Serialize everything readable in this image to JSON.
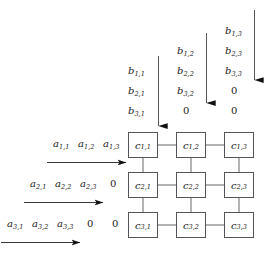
{
  "diagram": {
    "type": "systolic-array",
    "colors": {
      "stroke": "#555555",
      "text": "#1a1a1a",
      "background": "#ffffff"
    },
    "grid": {
      "rows": 3,
      "cols": 3,
      "cells": [
        [
          {
            "base": "c",
            "sub": "1,1"
          },
          {
            "base": "c",
            "sub": "1,2"
          },
          {
            "base": "c",
            "sub": "1,3"
          }
        ],
        [
          {
            "base": "c",
            "sub": "2,1"
          },
          {
            "base": "c",
            "sub": "2,2"
          },
          {
            "base": "c",
            "sub": "2,3"
          }
        ],
        [
          {
            "base": "c",
            "sub": "3,1"
          },
          {
            "base": "c",
            "sub": "3,2"
          },
          {
            "base": "c",
            "sub": "3,3"
          }
        ]
      ]
    },
    "top_inputs": {
      "description": "b matrix values fed downward into each column, skewed",
      "columns": [
        {
          "index": 1,
          "values": [
            "b_1,1",
            "b_2,1",
            "b_3,1"
          ],
          "tokens": [
            {
              "base": "b",
              "sub": "1,1"
            },
            {
              "base": "b",
              "sub": "2,1"
            },
            {
              "base": "b",
              "sub": "3,1"
            }
          ]
        },
        {
          "index": 2,
          "values": [
            "b_1,2",
            "b_2,2",
            "b_3,2",
            "0"
          ],
          "tokens": [
            {
              "base": "b",
              "sub": "1,2"
            },
            {
              "base": "b",
              "sub": "2,2"
            },
            {
              "base": "b",
              "sub": "3,2"
            },
            {
              "base": "0",
              "sub": ""
            }
          ]
        },
        {
          "index": 3,
          "values": [
            "b_1,3",
            "b_2,3",
            "b_3,3",
            "0",
            "0"
          ],
          "tokens": [
            {
              "base": "b",
              "sub": "1,3"
            },
            {
              "base": "b",
              "sub": "2,3"
            },
            {
              "base": "b",
              "sub": "3,3"
            },
            {
              "base": "0",
              "sub": ""
            },
            {
              "base": "0",
              "sub": ""
            }
          ]
        }
      ]
    },
    "left_inputs": {
      "description": "a matrix values fed rightward into each row, skewed",
      "rows": [
        {
          "index": 1,
          "values": [
            "a_1,1",
            "a_1,2",
            "a_1,3"
          ],
          "tokens": [
            {
              "base": "a",
              "sub": "1,1"
            },
            {
              "base": "a",
              "sub": "1,2"
            },
            {
              "base": "a",
              "sub": "1,3"
            }
          ]
        },
        {
          "index": 2,
          "values": [
            "a_2,1",
            "a_2,2",
            "a_2,3",
            "0"
          ],
          "tokens": [
            {
              "base": "a",
              "sub": "2,1"
            },
            {
              "base": "a",
              "sub": "2,2"
            },
            {
              "base": "a",
              "sub": "2,3"
            },
            {
              "base": "0",
              "sub": ""
            }
          ]
        },
        {
          "index": 3,
          "values": [
            "a_3,1",
            "a_3,2",
            "a_3,3",
            "0",
            "0"
          ],
          "tokens": [
            {
              "base": "a",
              "sub": "3,1"
            },
            {
              "base": "a",
              "sub": "3,2"
            },
            {
              "base": "a",
              "sub": "3,3"
            },
            {
              "base": "0",
              "sub": ""
            },
            {
              "base": "0",
              "sub": ""
            }
          ]
        }
      ]
    },
    "arrows": {
      "vertical_count": 3,
      "horizontal_count": 3,
      "vertical_label": "b-input-arrow",
      "horizontal_label": "a-input-arrow"
    }
  }
}
